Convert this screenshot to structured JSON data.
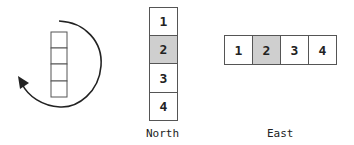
{
  "rotation_figure": {
    "icon": "rotate-counterclockwise-arrow",
    "stack_cells": 4
  },
  "north": {
    "label": "North",
    "cells": [
      "1",
      "2",
      "3",
      "4"
    ],
    "highlighted_index": 1
  },
  "east": {
    "label": "East",
    "cells": [
      "1",
      "2",
      "3",
      "4"
    ],
    "highlighted_index": 1
  },
  "colors": {
    "highlight": "#cfcfcf",
    "border": "#555555"
  }
}
